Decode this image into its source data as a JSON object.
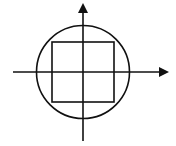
{
  "diagram": {
    "type": "geometry",
    "stroke_color": "#111111",
    "background": "#ffffff",
    "axes": {
      "x_axis": {
        "x1": 13,
        "y": 72,
        "x2": 160,
        "arrow": "right"
      },
      "y_axis": {
        "x": 83,
        "y1": 141,
        "y2": 12,
        "arrow": "up"
      }
    },
    "circle": {
      "cx": 83,
      "cy": 72,
      "r": 46.5
    },
    "square": {
      "x": 52,
      "y": 42,
      "width": 62,
      "height": 60
    }
  }
}
